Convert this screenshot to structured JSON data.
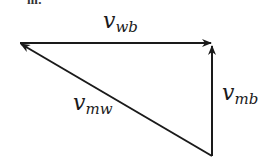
{
  "top_fragment": "m:",
  "vectors": {
    "wb": {
      "symbol": "v",
      "subscript": "wb"
    },
    "mb": {
      "symbol": "v",
      "subscript": "mb"
    },
    "mw": {
      "symbol": "v",
      "subscript": "mw"
    }
  },
  "colors": {
    "stroke": "#1a1a1a",
    "background": "#ffffff"
  }
}
